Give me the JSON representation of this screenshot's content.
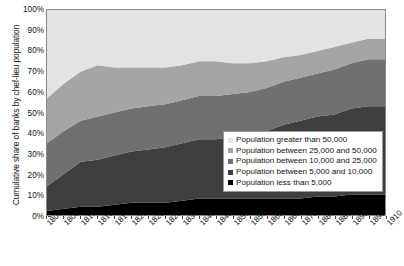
{
  "chart_data": {
    "type": "area",
    "title": "",
    "subtitle": "",
    "xlabel": "",
    "ylabel": "Cumulative share of banks by chef-lieu population",
    "stacked": true,
    "grid": false,
    "legend_position": "inside-lower-right",
    "ylim": [
      0,
      100
    ],
    "ytick_labels": [
      "0%",
      "10%",
      "20%",
      "30%",
      "40%",
      "50%",
      "60%",
      "70%",
      "80%",
      "90%",
      "100%"
    ],
    "ytick_values": [
      0,
      10,
      20,
      30,
      40,
      50,
      60,
      70,
      80,
      90,
      100
    ],
    "categories": [
      "1801",
      "1805",
      "1810",
      "1813",
      "1817",
      "1820",
      "1825",
      "1829",
      "1834",
      "1840",
      "1845",
      "1851",
      "1856",
      "1862",
      "1869",
      "1875",
      "1881",
      "1886",
      "1892",
      "1898",
      "1910"
    ],
    "series": [
      {
        "name": "Population less than 5,000",
        "color": "#000000",
        "values": [
          2,
          3,
          4,
          4,
          5,
          6,
          6,
          6,
          7,
          8,
          8,
          8,
          8,
          8,
          8,
          8,
          9,
          9,
          10,
          10,
          10
        ]
      },
      {
        "name": "Population between 5,000 and 10,000",
        "color": "#3f3f3f",
        "values": [
          12,
          17,
          22,
          23,
          24,
          25,
          26,
          27,
          28,
          29,
          29,
          30,
          31,
          33,
          36,
          38,
          39,
          40,
          42,
          43,
          43
        ]
      },
      {
        "name": "Population between 10,000 and 25,000",
        "color": "#707070",
        "values": [
          21,
          21,
          20,
          21,
          21,
          21,
          21,
          21,
          21,
          21,
          21,
          21,
          21,
          21,
          21,
          21,
          21,
          22,
          22,
          23,
          23
        ]
      },
      {
        "name": "Population between 25,000 and 50,000",
        "color": "#a5a5a5",
        "values": [
          22,
          23,
          24,
          25,
          22,
          20,
          19,
          18,
          17,
          17,
          17,
          15,
          14,
          13,
          12,
          11,
          11,
          11,
          10,
          10,
          10
        ]
      },
      {
        "name": "Population greater than 50,000",
        "color": "#e3e3e3",
        "values": [
          43,
          36,
          30,
          27,
          28,
          28,
          28,
          28,
          27,
          25,
          25,
          26,
          26,
          25,
          23,
          22,
          20,
          18,
          16,
          14,
          14
        ]
      }
    ],
    "cumulative_tops": {
      "less_than_5000": [
        2,
        3,
        4,
        4,
        5,
        6,
        6,
        6,
        7,
        8,
        8,
        8,
        8,
        8,
        8,
        8,
        9,
        9,
        10,
        10,
        10
      ],
      "between_5000_10000": [
        14,
        20,
        26,
        27,
        29,
        31,
        32,
        33,
        35,
        37,
        37,
        38,
        39,
        41,
        44,
        46,
        48,
        49,
        52,
        53,
        53
      ],
      "between_10000_25000": [
        35,
        41,
        46,
        48,
        50,
        52,
        53,
        54,
        56,
        58,
        58,
        59,
        60,
        62,
        65,
        67,
        69,
        71,
        74,
        76,
        76
      ],
      "between_25000_50000": [
        57,
        64,
        70,
        73,
        72,
        72,
        72,
        72,
        73,
        75,
        75,
        74,
        74,
        75,
        77,
        78,
        80,
        82,
        84,
        86,
        86
      ],
      "greater_than_50000": [
        100,
        100,
        100,
        100,
        100,
        100,
        100,
        100,
        100,
        100,
        100,
        100,
        100,
        100,
        100,
        100,
        100,
        100,
        100,
        100,
        100
      ]
    }
  },
  "legend": {
    "items": [
      {
        "label": "Population greater than 50,000",
        "color": "#e3e3e3"
      },
      {
        "label": "Population between 25,000 and 50,000",
        "color": "#a5a5a5"
      },
      {
        "label": "Population between 10,000 and 25,000",
        "color": "#707070"
      },
      {
        "label": "Population between 5,000 and 10,000",
        "color": "#3f3f3f"
      },
      {
        "label": "Population less than 5,000",
        "color": "#000000"
      }
    ]
  }
}
